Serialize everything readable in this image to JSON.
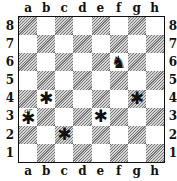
{
  "diagram": {
    "type": "chess-position",
    "files": [
      "a",
      "b",
      "c",
      "d",
      "e",
      "f",
      "g",
      "h"
    ],
    "ranks": [
      "8",
      "7",
      "6",
      "5",
      "4",
      "3",
      "2",
      "1"
    ],
    "colors": {
      "light_square": "#ffffff",
      "dark_square": "#bdbdbd",
      "border": "#111111"
    },
    "pieces": [
      {
        "square": "f6",
        "piece": "knight",
        "color": "black",
        "glyph": "♞"
      }
    ],
    "marked_squares": [
      {
        "square": "b4",
        "glyph": "✱"
      },
      {
        "square": "g4",
        "glyph": "✱"
      },
      {
        "square": "a3",
        "glyph": "✱",
        "note": "or"
      },
      {
        "square": "e3",
        "glyph": "✱"
      },
      {
        "square": "c2",
        "glyph": "✱"
      }
    ]
  }
}
